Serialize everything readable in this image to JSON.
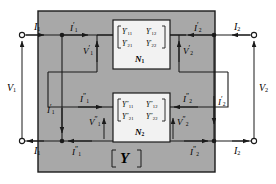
{
  "figure": {
    "type": "two-port-network-parallel-connection",
    "outer_block_label": "[Y]",
    "background_fill": "#a8a8a8",
    "stroke_color": "#1a1a1a",
    "box_fill": "#f2f2f2"
  },
  "terminals": {
    "left_top_current": "I1",
    "left_bottom_current": "I1",
    "right_top_current": "I2",
    "right_bottom_current": "I2",
    "left_voltage": "V1",
    "right_voltage": "V2"
  },
  "subnetworks": [
    {
      "id": "N1",
      "name": "N1",
      "matrix": {
        "rows": [
          [
            "Y'11",
            "Y'12"
          ],
          [
            "Y'21",
            "Y'22"
          ]
        ]
      },
      "port_currents": {
        "input": "I'1",
        "output": "I'2",
        "input_branch": "I'1",
        "output_branch": "I'2"
      },
      "port_voltages": {
        "input": "V'1",
        "output": "V'2"
      }
    },
    {
      "id": "N2",
      "name": "N2",
      "matrix": {
        "rows": [
          [
            "Y\"11",
            "Y\"12"
          ],
          [
            "Y\"21",
            "Y\"22"
          ]
        ]
      },
      "port_currents": {
        "input": "I\"1",
        "output": "I\"2",
        "input_return": "I\"1",
        "output_return": "I\"2"
      },
      "port_voltages": {
        "input": "V\"1",
        "output": "V\"2"
      }
    }
  ],
  "labels": {
    "I1_top_left": {
      "base": "I",
      "sub": "1",
      "prime": ""
    },
    "I1_bottom_left": {
      "base": "I",
      "sub": "1",
      "prime": ""
    },
    "I2_top_right": {
      "base": "I",
      "sub": "2",
      "prime": ""
    },
    "I2_bottom_right": {
      "base": "I",
      "sub": "2",
      "prime": ""
    },
    "V1": {
      "base": "V",
      "sub": "1",
      "prime": ""
    },
    "V2": {
      "base": "V",
      "sub": "2",
      "prime": ""
    },
    "Ip1_top": {
      "base": "I",
      "sub": "1",
      "prime": "′"
    },
    "Ip2_top": {
      "base": "I",
      "sub": "2",
      "prime": "′"
    },
    "Vp1": {
      "base": "V",
      "sub": "1",
      "prime": "′"
    },
    "Vp2": {
      "base": "V",
      "sub": "2",
      "prime": "′"
    },
    "Ip1_branch": {
      "base": "I",
      "sub": "1",
      "prime": "′"
    },
    "Ip2_branch": {
      "base": "I",
      "sub": "2",
      "prime": "′"
    },
    "Ipp1_mid": {
      "base": "I",
      "sub": "1",
      "prime": "″"
    },
    "Ipp2_mid": {
      "base": "I",
      "sub": "2",
      "prime": "″"
    },
    "Vpp1": {
      "base": "V",
      "sub": "1",
      "prime": "″"
    },
    "Vpp2": {
      "base": "V",
      "sub": "2",
      "prime": "″"
    },
    "Ipp1_bottom": {
      "base": "I",
      "sub": "1",
      "prime": "″"
    },
    "Ipp2_bottom": {
      "base": "I",
      "sub": "2",
      "prime": "″"
    },
    "N1": "N",
    "N1_sub": "1",
    "N2": "N",
    "N2_sub": "2",
    "Y_block": "Y",
    "bracket_open": "[",
    "bracket_close": "]"
  },
  "matrix_entries": {
    "N1": {
      "r1c1_base": "Y",
      "r1c1_prime": "′",
      "r1c1_sub": "11",
      "r1c2_base": "Y",
      "r1c2_prime": "′",
      "r1c2_sub": "12",
      "r2c1_base": "Y",
      "r2c1_prime": "′",
      "r2c1_sub": "21",
      "r2c2_base": "Y",
      "r2c2_prime": "′",
      "r2c2_sub": "22"
    },
    "N2": {
      "r1c1_base": "Y",
      "r1c1_prime": "″",
      "r1c1_sub": "11",
      "r1c2_base": "Y",
      "r1c2_prime": "″",
      "r1c2_sub": "12",
      "r2c1_base": "Y",
      "r2c1_prime": "″",
      "r2c1_sub": "21",
      "r2c2_base": "Y",
      "r2c2_prime": "″",
      "r2c2_sub": "22"
    }
  }
}
